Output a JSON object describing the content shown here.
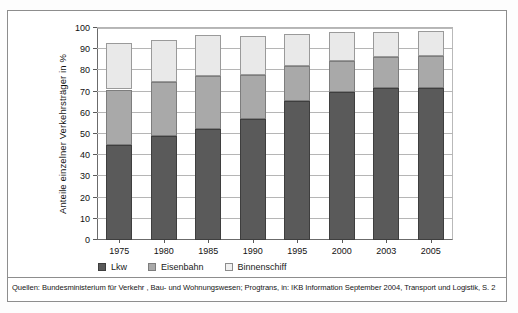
{
  "chart_data": {
    "type": "bar",
    "subtype": "stacked-column",
    "title": "",
    "xlabel": "",
    "ylabel": "Anteile einzelner Verkehrsträger in %",
    "categories": [
      "1975",
      "1980",
      "1985",
      "1990",
      "1995",
      "2000",
      "2003",
      "2005"
    ],
    "ylim": [
      0,
      100
    ],
    "yticks": [
      0,
      10,
      20,
      30,
      40,
      50,
      60,
      70,
      80,
      90,
      100
    ],
    "ytick_labels": [
      "0",
      "10",
      "20",
      "30",
      "40",
      "50",
      "60",
      "70",
      "80",
      "90",
      "100"
    ],
    "grid": true,
    "legend_position": "bottom-left",
    "series": [
      {
        "name": "Lkw",
        "color": "#5a5a5a",
        "values": [
          45,
          49,
          52.5,
          57,
          65.5,
          70,
          71.5,
          71.5
        ]
      },
      {
        "name": "Eisenbahn",
        "color": "#a9a9a9",
        "values": [
          26,
          25.5,
          25,
          21,
          16.5,
          14.5,
          15,
          15.5
        ]
      },
      {
        "name": "Binnenschiff",
        "color": "#e9e9e9",
        "values": [
          22,
          20,
          19,
          18,
          15,
          13.5,
          11.5,
          11.5
        ]
      }
    ],
    "cumulative_tops": {
      "lkw": [
        45,
        49,
        52.5,
        57,
        65.5,
        70,
        71.5,
        71.5
      ],
      "eisenbahn": [
        71,
        74.5,
        77.5,
        78,
        82,
        84.5,
        86.5,
        87
      ],
      "binnenschiff": [
        93,
        94.5,
        96.5,
        96,
        97,
        98,
        98,
        98.5
      ]
    }
  },
  "legend": {
    "items": [
      {
        "label": "Lkw",
        "swatch": "lkw-swatch"
      },
      {
        "label": "Eisenbahn",
        "swatch": "eisenbahn-swatch"
      },
      {
        "label": "Binnenschiff",
        "swatch": "binnenschiff-swatch"
      }
    ]
  },
  "source": {
    "note": "Quellen: Bundesministerium für Verkehr , Bau- und Wohnungswesen; Progtrans, in: IKB Information September 2004, Transport und Logistik, S. 2"
  }
}
